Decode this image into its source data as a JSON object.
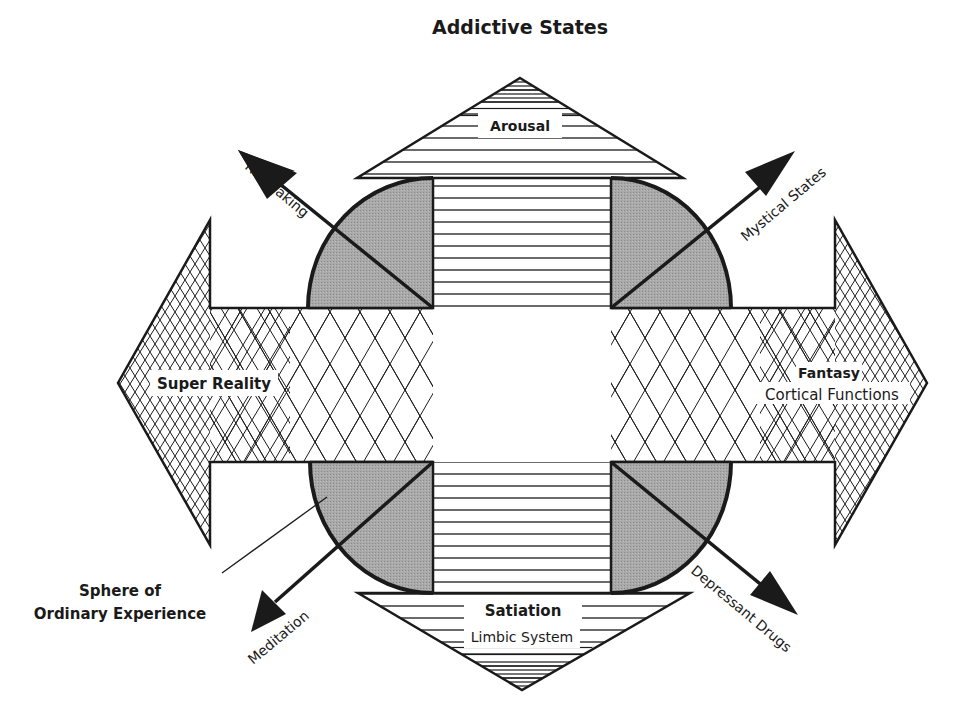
{
  "title": "Addictive States",
  "colors": {
    "ink": "#1a1a1a",
    "corner_fill": "#a8a8a8",
    "background": "#ffffff"
  },
  "arrows": {
    "top": {
      "label": "Arousal"
    },
    "bottom": {
      "label": "Satiation",
      "sublabel": "Limbic System"
    },
    "left": {
      "label": "Super Reality"
    },
    "right": {
      "label": "Fantasy",
      "sublabel": "Cortical Functions"
    }
  },
  "diagonals": {
    "top_left": "Risk Taking",
    "top_right": "Mystical States",
    "bottom_left": "Meditation",
    "bottom_right": "Depressant Drugs"
  },
  "callout": {
    "line1": "Sphere of",
    "line2": "Ordinary Experience"
  }
}
